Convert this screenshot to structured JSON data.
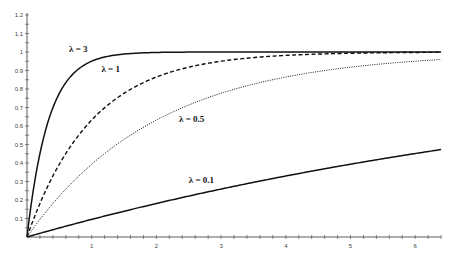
{
  "chart_data": {
    "type": "line",
    "title": "",
    "xlabel": "",
    "ylabel": "",
    "xlim": [
      0,
      6.4
    ],
    "ylim": [
      0,
      1.2
    ],
    "grid": false,
    "legend": "inline labels",
    "function": "y = 1 - exp(-lambda * x)",
    "x_ticks": [
      1,
      2,
      3,
      4,
      5,
      6
    ],
    "x_tick_labels": [
      "1",
      "2",
      "3",
      "4",
      "5",
      "6"
    ],
    "y_ticks": [
      0.1,
      0.2,
      0.3,
      0.4,
      0.5,
      0.6,
      0.7,
      0.8,
      0.9,
      1,
      1.1,
      1.2
    ],
    "y_tick_labels": [
      "0.1",
      "0.2",
      "0.3",
      "0.4",
      "0.5",
      "0.6",
      "0.7",
      "0.8",
      "0.9",
      "1",
      "1.1",
      "1.2"
    ],
    "x": [
      0,
      0.5,
      1,
      1.5,
      2,
      2.5,
      3,
      3.5,
      4,
      4.5,
      5,
      5.5,
      6,
      6.4
    ],
    "series": [
      {
        "name": "λ = 3",
        "lambda": 3,
        "style": "solid",
        "label_pos": [
          0.65,
          1.0
        ],
        "values": [
          0,
          0.78,
          0.95,
          0.99,
          1.0,
          1.0,
          1.0,
          1.0,
          1.0,
          1.0,
          1.0,
          1.0,
          1.0,
          1.0
        ]
      },
      {
        "name": "λ = 1",
        "lambda": 1,
        "style": "dashed",
        "label_pos": [
          1.15,
          0.89
        ],
        "values": [
          0,
          0.39,
          0.63,
          0.78,
          0.86,
          0.92,
          0.95,
          0.97,
          0.98,
          0.99,
          0.99,
          1.0,
          1.0,
          1.0
        ]
      },
      {
        "name": "λ = 0.5",
        "lambda": 0.5,
        "style": "dotted",
        "label_pos": [
          2.35,
          0.62
        ],
        "values": [
          0,
          0.22,
          0.39,
          0.53,
          0.63,
          0.71,
          0.78,
          0.83,
          0.86,
          0.89,
          0.92,
          0.94,
          0.95,
          0.96
        ]
      },
      {
        "name": "λ = 0.1",
        "lambda": 0.1,
        "style": "solid",
        "label_pos": [
          2.5,
          0.29
        ],
        "values": [
          0,
          0.05,
          0.1,
          0.14,
          0.18,
          0.22,
          0.26,
          0.3,
          0.33,
          0.36,
          0.39,
          0.42,
          0.45,
          0.47
        ]
      }
    ]
  }
}
